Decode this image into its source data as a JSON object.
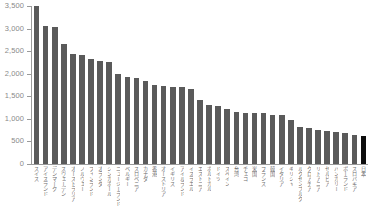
{
  "chart_data": {
    "type": "bar",
    "title": "",
    "subtitle": "",
    "xlabel": "",
    "ylabel": "",
    "ylim": [
      0,
      3500
    ],
    "grid": false,
    "legend": "none",
    "y_ticks": [
      "0",
      "500",
      "1,000",
      "1,500",
      "2,000",
      "2,500",
      "3,000",
      "3,500"
    ],
    "y_tick_values": [
      0,
      500,
      1000,
      1500,
      2000,
      2500,
      3000,
      3500
    ],
    "bar_color": "#5a5a5a",
    "highlight_color": "#0d0d0d",
    "highlight_category": "日本",
    "categories": [
      "スイス",
      "アイスランド",
      "デンマーク",
      "スウェーデン",
      "オーストラリア",
      "ノルウェー",
      "フィンランド",
      "オランダ",
      "シンガポール",
      "ニュージーランド",
      "ベルギー",
      "スロベニア",
      "カナダ",
      "香港",
      "オーストリア",
      "イギリス",
      "アイルランド",
      "イスラエル",
      "エストニア",
      "ポルトガル",
      "ドイツ",
      "スペイン",
      "台湾",
      "チェコ",
      "米国",
      "フランス",
      "韓国",
      "イタリア",
      "ギリシャ",
      "ルクセンブルク",
      "クロアチア",
      "リトアニア",
      "セルビア",
      "ハンガリー",
      "ポーランド",
      "スロバキア",
      "日本"
    ],
    "values": [
      3500,
      3050,
      3030,
      2650,
      2440,
      2410,
      2320,
      2290,
      2260,
      1990,
      1930,
      1910,
      1840,
      1760,
      1720,
      1710,
      1710,
      1660,
      1420,
      1300,
      1280,
      1220,
      1160,
      1130,
      1130,
      1130,
      1090,
      1080,
      970,
      820,
      800,
      760,
      730,
      710,
      680,
      650,
      630
    ]
  }
}
